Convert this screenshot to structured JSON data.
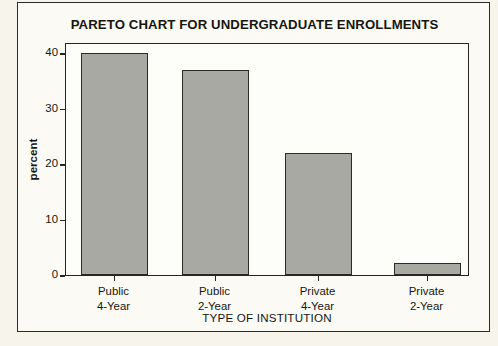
{
  "chart_data": {
    "type": "bar",
    "title": "PARETO CHART FOR UNDERGRADUATE ENROLLMENTS",
    "xlabel": "TYPE OF INSTITUTION",
    "ylabel": "percent",
    "categories": [
      {
        "line1": "Public",
        "line2": "4-Year"
      },
      {
        "line1": "Public",
        "line2": "2-Year"
      },
      {
        "line1": "Private",
        "line2": "4-Year"
      },
      {
        "line1": "Private",
        "line2": "2-Year"
      }
    ],
    "values": [
      40,
      37,
      22,
      2.2
    ],
    "ylim": [
      0,
      42
    ],
    "yticks": [
      0,
      10,
      20,
      30,
      40
    ],
    "ytick_labels": [
      "0",
      "10",
      "20",
      "30",
      "40"
    ],
    "grid": false,
    "legend": null,
    "bar_color": "#a9a9a4",
    "bar_edge_color": "#2b2b26",
    "plot_background": "#fdfdf9",
    "page_background": "#fcfaf4",
    "axis_color": "#26261f",
    "text_color": "#16160f"
  }
}
